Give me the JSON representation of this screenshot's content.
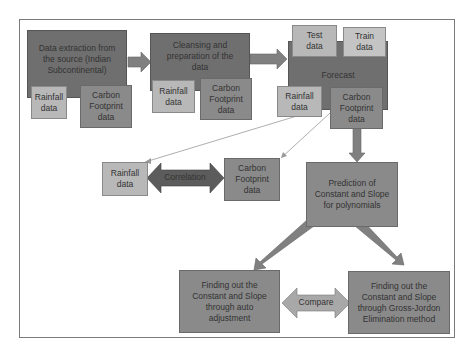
{
  "diagram": {
    "stage1": {
      "title": "Data extraction from the source (Indian Subcontinental)",
      "rainfall": "Rainfall data",
      "carbon": "Carbon Footprint data"
    },
    "stage2": {
      "title": "Cleansing and preparation of the data",
      "rainfall": "Rainfall data",
      "carbon": "Carbon Footprint data"
    },
    "stage3": {
      "title": "Forecast",
      "test": "Test data",
      "train": "Train data",
      "rainfall": "Rainfall data",
      "carbon": "Carbon Footprint data"
    },
    "correlation": {
      "rainfall": "Rainfall data",
      "label": "Correlation",
      "carbon": "Carbon Footprint data"
    },
    "prediction": "Prediction of Constant and Slope for polynomials",
    "auto": "Finding out the Constant and Slope through auto adjustment",
    "compare": "Compare",
    "gauss": "Finding out the Constant and Slope through Gross-Jordon Elimination method"
  },
  "colors": {
    "dark": "#6f6f6f",
    "mid": "#8a8a8a",
    "light": "#b8b8b8",
    "border": "#7a7a7a"
  }
}
